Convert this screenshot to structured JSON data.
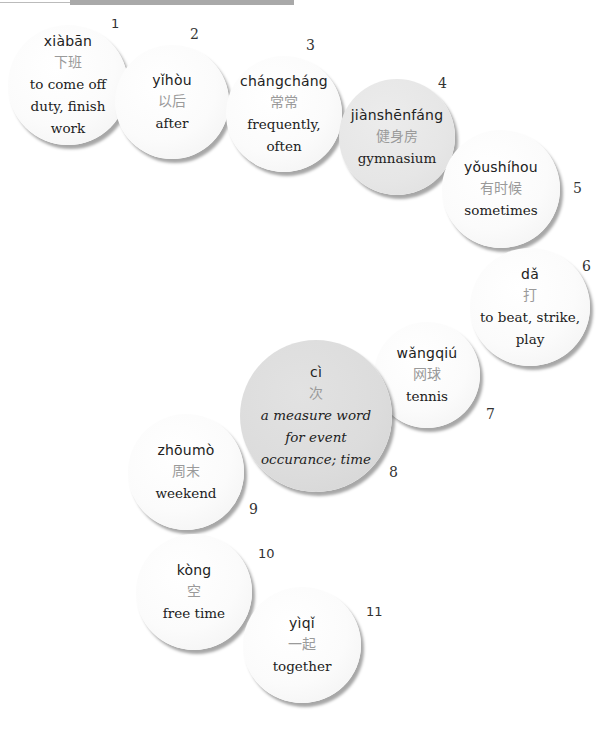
{
  "header": {
    "bar": "decorative-header-bar"
  },
  "vocab": [
    {
      "number": "1",
      "pinyin": "xiàbān",
      "hanzi": "下班",
      "meaning": "to come off duty, finish work",
      "lines": [
        "to come off",
        "duty, finish",
        "work"
      ]
    },
    {
      "number": "2",
      "pinyin": "yǐhòu",
      "hanzi": "以后",
      "meaning": "after",
      "lines": [
        "after"
      ]
    },
    {
      "number": "3",
      "pinyin": "chángcháng",
      "hanzi": "常常",
      "meaning": "frequently, often",
      "lines": [
        "frequently,",
        "often"
      ]
    },
    {
      "number": "4",
      "pinyin": "jiànshēnfáng",
      "hanzi": "健身房",
      "meaning": "gymnasium",
      "lines": [
        "gymnasium"
      ]
    },
    {
      "number": "5",
      "pinyin": "yǒushíhou",
      "hanzi": "有时候",
      "meaning": "sometimes",
      "lines": [
        "sometimes"
      ]
    },
    {
      "number": "6",
      "pinyin": "dǎ",
      "hanzi": "打",
      "meaning": "to beat, strike, play",
      "lines": [
        "to beat, strike,",
        "play"
      ]
    },
    {
      "number": "7",
      "pinyin": "wǎngqiú",
      "hanzi": "网球",
      "meaning": "tennis",
      "lines": [
        "tennis"
      ]
    },
    {
      "number": "8",
      "pinyin": "cì",
      "hanzi": "次",
      "meaning": "a measure word for event occurance; time",
      "lines": [
        "a measure word",
        "for event",
        "occurance; time"
      ]
    },
    {
      "number": "9",
      "pinyin": "zhōumò",
      "hanzi": "周末",
      "meaning": "weekend",
      "lines": [
        "weekend"
      ]
    },
    {
      "number": "10",
      "pinyin": "kòng",
      "hanzi": "空",
      "meaning": "free time",
      "lines": [
        "free time"
      ]
    },
    {
      "number": "11",
      "pinyin": "yìqǐ",
      "hanzi": "一起",
      "meaning": "together",
      "lines": [
        "together"
      ]
    }
  ],
  "colors": {
    "hanzi": "#9a9a9a",
    "text": "#222222",
    "gray_bubble": "#e6e6e6",
    "dark_gray_bubble": "#dcdcdc",
    "header_bar": "#a9a9a9"
  }
}
